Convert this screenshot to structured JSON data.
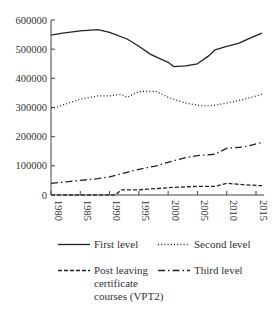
{
  "chart_data": {
    "type": "line",
    "title": "",
    "xlabel": "",
    "ylabel": "",
    "xlim": [
      1980,
      2016
    ],
    "ylim": [
      0,
      600000
    ],
    "grid": false,
    "legend_position": "bottom",
    "x_ticks": [
      1980,
      1985,
      1990,
      1995,
      2000,
      2005,
      2010,
      2015
    ],
    "x_tick_labels": [
      "1980",
      "1985",
      "1990",
      "1995",
      "2000",
      "2005",
      "2010",
      "2015"
    ],
    "y_ticks": [
      0,
      100000,
      200000,
      300000,
      400000,
      500000,
      600000
    ],
    "y_tick_labels": [
      "0",
      "100000",
      "200000",
      "300000",
      "400000",
      "500000",
      "600000"
    ],
    "series": [
      {
        "name": "First level",
        "style": "solid",
        "x": [
          1980,
          1982,
          1985,
          1988,
          1990,
          1993,
          1995,
          1997,
          2000,
          2001,
          2003,
          2005,
          2007,
          2008,
          2010,
          2012,
          2014,
          2016
        ],
        "values": [
          548000,
          555000,
          563000,
          567000,
          558000,
          535000,
          510000,
          482000,
          455000,
          440000,
          443000,
          450000,
          478000,
          498000,
          510000,
          520000,
          538000,
          555000
        ]
      },
      {
        "name": "Second level",
        "style": "dotted",
        "x": [
          1980,
          1983,
          1985,
          1988,
          1990,
          1992,
          1993,
          1995,
          1998,
          2000,
          2003,
          2006,
          2008,
          2010,
          2013,
          2016
        ],
        "values": [
          295000,
          315000,
          328000,
          340000,
          340000,
          345000,
          335000,
          355000,
          355000,
          335000,
          315000,
          305000,
          308000,
          315000,
          328000,
          345000
        ]
      },
      {
        "name": "Post leaving certificate courses (VPT2)",
        "style": "dashed",
        "x": [
          1980,
          1991,
          1992,
          1995,
          1998,
          2000,
          2003,
          2005,
          2008,
          2010,
          2013,
          2016
        ],
        "values": [
          0,
          0,
          18000,
          18000,
          22000,
          25000,
          28000,
          30000,
          30000,
          40000,
          35000,
          32000
        ]
      },
      {
        "name": "Third level",
        "style": "dash-dot",
        "x": [
          1980,
          1983,
          1985,
          1988,
          1990,
          1993,
          1995,
          1998,
          2000,
          2003,
          2005,
          2008,
          2010,
          2013,
          2016
        ],
        "values": [
          40000,
          46000,
          50000,
          56000,
          62000,
          78000,
          88000,
          100000,
          112000,
          128000,
          135000,
          140000,
          160000,
          165000,
          180000
        ]
      }
    ]
  },
  "legend": {
    "items": [
      {
        "label": "First level"
      },
      {
        "label": "Second level"
      },
      {
        "label": "Post leaving\ncertificate\ncourses (VPT2)"
      },
      {
        "label": "Third level"
      }
    ]
  }
}
